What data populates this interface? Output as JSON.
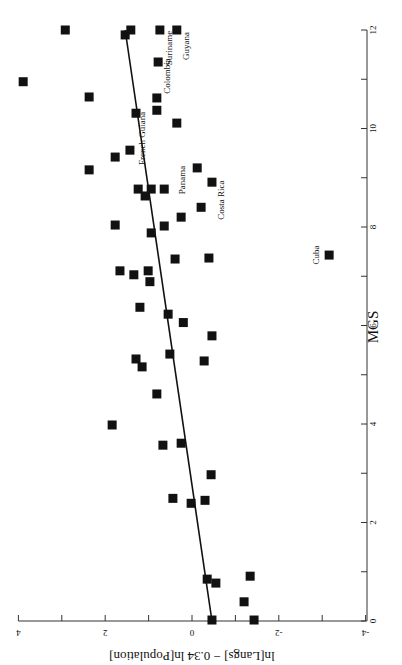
{
  "chart_data": {
    "type": "scatter",
    "orientation": "rotated 90 degrees clockwise (x axis vertical on right, y axis horizontal at bottom)",
    "title": "",
    "xlabel": "MGS",
    "ylabel": "ln[Langs] − 0.34 ln[Population]",
    "xlim": [
      0,
      12
    ],
    "ylim": [
      -4,
      4
    ],
    "x_ticks": [
      0,
      2,
      4,
      6,
      8,
      10,
      12
    ],
    "y_ticks": [
      -4,
      -2,
      0,
      2,
      4
    ],
    "grid": false,
    "legend": null,
    "marker": "filled square",
    "marker_color": "#111111",
    "points": [
      {
        "x": 12.0,
        "y": 2.92
      },
      {
        "x": 11.9,
        "y": 1.54
      },
      {
        "x": 12.0,
        "y": 1.41
      },
      {
        "x": 12.0,
        "y": 0.74,
        "label": "Suriname"
      },
      {
        "x": 12.0,
        "y": 0.35,
        "label": "Guyana"
      },
      {
        "x": 11.35,
        "y": 0.78,
        "label": "Colombia"
      },
      {
        "x": 10.95,
        "y": 3.89
      },
      {
        "x": 10.64,
        "y": 2.37
      },
      {
        "x": 10.62,
        "y": 0.81
      },
      {
        "x": 10.31,
        "y": 1.29
      },
      {
        "x": 10.37,
        "y": 0.81,
        "label": "French Guiana"
      },
      {
        "x": 10.11,
        "y": 0.35
      },
      {
        "x": 9.56,
        "y": 1.43
      },
      {
        "x": 9.42,
        "y": 1.77
      },
      {
        "x": 9.16,
        "y": 2.37
      },
      {
        "x": 9.2,
        "y": -0.12,
        "label": "Panama"
      },
      {
        "x": 8.91,
        "y": -0.46,
        "label": "Costa Rica"
      },
      {
        "x": 8.77,
        "y": 1.24
      },
      {
        "x": 8.77,
        "y": 0.94
      },
      {
        "x": 8.77,
        "y": 0.64
      },
      {
        "x": 8.63,
        "y": 1.08
      },
      {
        "x": 8.4,
        "y": -0.21
      },
      {
        "x": 8.2,
        "y": 0.25
      },
      {
        "x": 8.04,
        "y": 1.77
      },
      {
        "x": 8.02,
        "y": 0.64
      },
      {
        "x": 7.88,
        "y": 0.94
      },
      {
        "x": 7.43,
        "y": -3.16,
        "label": "Cuba"
      },
      {
        "x": 7.35,
        "y": 0.39
      },
      {
        "x": 7.37,
        "y": -0.39
      },
      {
        "x": 7.11,
        "y": 1.66
      },
      {
        "x": 7.11,
        "y": 1.01
      },
      {
        "x": 7.03,
        "y": 1.34
      },
      {
        "x": 6.89,
        "y": 0.97
      },
      {
        "x": 6.37,
        "y": 1.2
      },
      {
        "x": 6.23,
        "y": 0.55
      },
      {
        "x": 6.06,
        "y": 0.2
      },
      {
        "x": 5.32,
        "y": 1.29
      },
      {
        "x": 5.16,
        "y": 1.15
      },
      {
        "x": 5.42,
        "y": 0.51
      },
      {
        "x": 5.28,
        "y": -0.28
      },
      {
        "x": 5.79,
        "y": -0.46
      },
      {
        "x": 4.61,
        "y": 0.81
      },
      {
        "x": 3.98,
        "y": 1.84
      },
      {
        "x": 3.57,
        "y": 0.67
      },
      {
        "x": 3.61,
        "y": 0.25
      },
      {
        "x": 2.97,
        "y": -0.44
      },
      {
        "x": 2.49,
        "y": 0.44
      },
      {
        "x": 2.39,
        "y": 0.02
      },
      {
        "x": 2.45,
        "y": -0.3
      },
      {
        "x": 0.85,
        "y": -0.35
      },
      {
        "x": 0.77,
        "y": -0.55
      },
      {
        "x": 0.91,
        "y": -1.34
      },
      {
        "x": 0.39,
        "y": -1.2
      },
      {
        "x": 0.02,
        "y": -0.46
      },
      {
        "x": 0.02,
        "y": -1.43
      }
    ],
    "fit_line": {
      "x": [
        0,
        12
      ],
      "y": [
        -0.46,
        1.54
      ]
    },
    "annotations": [
      "Suriname",
      "Guyana",
      "Colombia",
      "French Guiana",
      "Panama",
      "Costa Rica",
      "Cuba"
    ]
  }
}
